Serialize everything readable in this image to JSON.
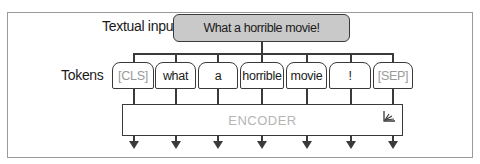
{
  "diagram": {
    "input_label": "Textual input",
    "input_text": "What a horrible movie!",
    "tokens_label": "Tokens",
    "tokens": [
      {
        "text": "[CLS]",
        "special": true
      },
      {
        "text": "what",
        "special": false
      },
      {
        "text": "a",
        "special": false
      },
      {
        "text": "horrible",
        "special": false
      },
      {
        "text": "movie",
        "special": false
      },
      {
        "text": "!",
        "special": false
      },
      {
        "text": "[SEP]",
        "special": true
      }
    ],
    "encoder_label": "ENCODER",
    "encoder_icon": "frozen-weights-icon",
    "colors": {
      "input_fill": "#c9c9c9",
      "stroke": "#3a3a3a",
      "special_token_text": "#9a9a9a",
      "encoder_text": "#b5b5b5"
    }
  }
}
